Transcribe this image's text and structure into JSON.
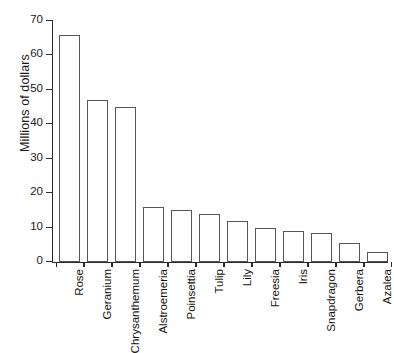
{
  "chart_data": {
    "type": "bar",
    "title": "",
    "xlabel": "",
    "ylabel": "Millions of dollars",
    "categories": [
      "Rose",
      "Geranium",
      "Chrysanthemum",
      "Alstroemeria",
      "Poinsettia",
      "Tulip",
      "Lily",
      "Freesia",
      "Iris",
      "Snapdragon",
      "Gerbera",
      "Azalea"
    ],
    "values": [
      66,
      47,
      45,
      16,
      15,
      14,
      12,
      10,
      9,
      8.5,
      5.5,
      3
    ],
    "ylim": [
      0,
      70
    ],
    "yticks": [
      0,
      10,
      20,
      30,
      40,
      50,
      60,
      70
    ],
    "ytick_labels": [
      "0",
      "10",
      "20",
      "30",
      "40",
      "50",
      "60",
      "70"
    ],
    "grid": false,
    "legend": null,
    "bar_fill_color": "#ffffff",
    "bar_edge_color": "#555555",
    "axis_color": "#2b2b2b",
    "text_color": "#141414"
  }
}
